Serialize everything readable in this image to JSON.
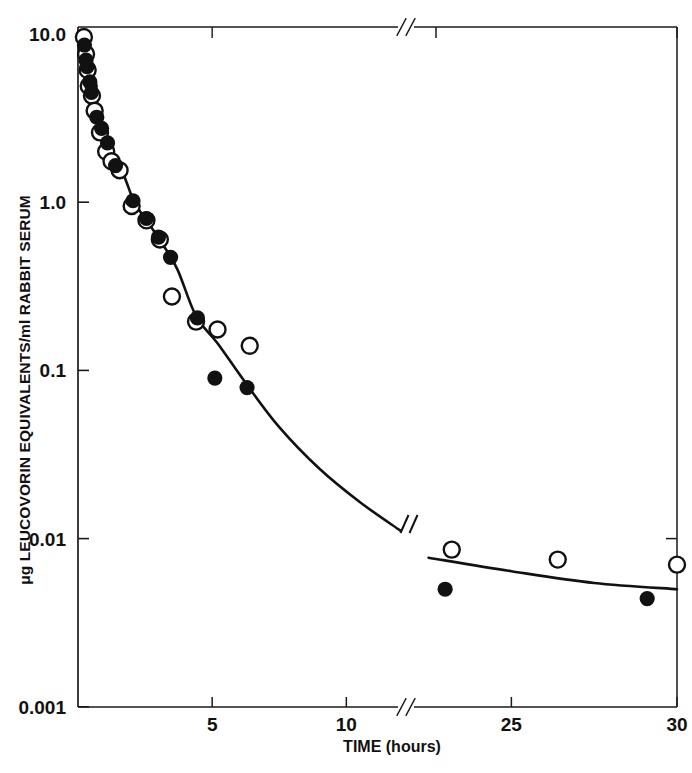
{
  "chart_data": {
    "type": "scatter",
    "title": "",
    "xlabel": "TIME (hours)",
    "ylabel": "μg LEUCOVORIN EQUIVALENTS/ml RABBIT SERUM",
    "yscale": "log",
    "ylim": [
      0.001,
      10.0
    ],
    "y_tick_labels": [
      "10.0",
      "1.0",
      "0.1",
      "0.01",
      "0.001"
    ],
    "y_tick_values": [
      10.0,
      1.0,
      0.1,
      0.01,
      0.001
    ],
    "x_tick_labels": [
      "5",
      "10",
      "25",
      "30"
    ],
    "x_tick_values": [
      5,
      10,
      25,
      30
    ],
    "x_axis_break": true,
    "x_axis_break_between": [
      12,
      22
    ],
    "grid": false,
    "legend_position": "none",
    "series": [
      {
        "name": "open-circles",
        "marker": "open-circle",
        "points": [
          {
            "x": 0.22,
            "y": 9.6
          },
          {
            "x": 0.3,
            "y": 7.6
          },
          {
            "x": 0.36,
            "y": 6.1
          },
          {
            "x": 0.4,
            "y": 4.9
          },
          {
            "x": 0.52,
            "y": 4.3
          },
          {
            "x": 0.62,
            "y": 3.5
          },
          {
            "x": 0.82,
            "y": 2.6
          },
          {
            "x": 1.05,
            "y": 2.0
          },
          {
            "x": 1.25,
            "y": 1.75
          },
          {
            "x": 1.55,
            "y": 1.55
          },
          {
            "x": 2.0,
            "y": 0.95
          },
          {
            "x": 2.55,
            "y": 0.78
          },
          {
            "x": 3.05,
            "y": 0.6
          },
          {
            "x": 3.5,
            "y": 0.275
          },
          {
            "x": 4.4,
            "y": 0.195
          },
          {
            "x": 5.2,
            "y": 0.175
          },
          {
            "x": 6.4,
            "y": 0.14
          },
          {
            "x": 23.2,
            "y": 0.0086
          },
          {
            "x": 26.4,
            "y": 0.0075
          },
          {
            "x": 30.0,
            "y": 0.007
          }
        ]
      },
      {
        "name": "filled-circles",
        "marker": "filled-circle",
        "points": [
          {
            "x": 0.24,
            "y": 8.6
          },
          {
            "x": 0.3,
            "y": 7.0
          },
          {
            "x": 0.34,
            "y": 6.4
          },
          {
            "x": 0.44,
            "y": 5.2
          },
          {
            "x": 0.5,
            "y": 4.5
          },
          {
            "x": 0.7,
            "y": 3.2
          },
          {
            "x": 0.88,
            "y": 2.75
          },
          {
            "x": 1.1,
            "y": 2.25
          },
          {
            "x": 1.4,
            "y": 1.65
          },
          {
            "x": 2.05,
            "y": 1.02
          },
          {
            "x": 2.55,
            "y": 0.8
          },
          {
            "x": 3.0,
            "y": 0.62
          },
          {
            "x": 3.45,
            "y": 0.47
          },
          {
            "x": 4.45,
            "y": 0.205
          },
          {
            "x": 5.1,
            "y": 0.09
          },
          {
            "x": 6.3,
            "y": 0.079
          },
          {
            "x": 23.0,
            "y": 0.005
          },
          {
            "x": 29.1,
            "y": 0.0044
          }
        ]
      }
    ],
    "fit_curve": {
      "name": "fitted-biexponential-curve",
      "has_break_marker": true,
      "points": [
        {
          "x": 0.3,
          "y": 7.2
        },
        {
          "x": 0.5,
          "y": 4.4
        },
        {
          "x": 0.75,
          "y": 3.0
        },
        {
          "x": 1.0,
          "y": 2.3
        },
        {
          "x": 1.35,
          "y": 1.75
        },
        {
          "x": 1.7,
          "y": 1.45
        },
        {
          "x": 2.1,
          "y": 1.0
        },
        {
          "x": 2.6,
          "y": 0.76
        },
        {
          "x": 3.1,
          "y": 0.58
        },
        {
          "x": 3.7,
          "y": 0.4
        },
        {
          "x": 4.4,
          "y": 0.21
        },
        {
          "x": 5.2,
          "y": 0.145
        },
        {
          "x": 6.3,
          "y": 0.082
        },
        {
          "x": 7.5,
          "y": 0.046
        },
        {
          "x": 9.0,
          "y": 0.026
        },
        {
          "x": 10.5,
          "y": 0.0165
        },
        {
          "x": 12.0,
          "y": 0.0112
        },
        {
          "x": 22.5,
          "y": 0.0077
        },
        {
          "x": 25.0,
          "y": 0.0064
        },
        {
          "x": 27.5,
          "y": 0.00545
        },
        {
          "x": 30.0,
          "y": 0.005
        }
      ]
    }
  }
}
